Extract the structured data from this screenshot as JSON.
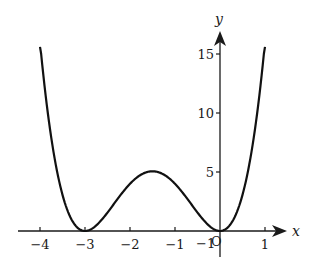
{
  "chart_data": {
    "type": "line",
    "title": "",
    "xlabel": "x",
    "ylabel": "y",
    "function": "y = x^2 (x + 3)^2",
    "xlim": [
      -4,
      1
    ],
    "ylim": [
      0,
      16
    ],
    "grid": false,
    "legend": null,
    "x_ticks": [
      -4,
      -3,
      -2,
      -1,
      1
    ],
    "x_tick_labels": [
      "−4",
      "−3",
      "−2",
      "−1",
      "1"
    ],
    "y_ticks": [
      5,
      10,
      15
    ],
    "y_tick_labels": [
      "5",
      "10",
      "15"
    ],
    "origin_label": "O",
    "series": [
      {
        "name": "curve",
        "x": [
          -4,
          -3.75,
          -3.5,
          -3.25,
          -3,
          -2.75,
          -2.5,
          -2.25,
          -2,
          -1.75,
          -1.5,
          -1.25,
          -1,
          -0.75,
          -0.5,
          -0.25,
          0,
          0.25,
          0.5,
          0.75,
          1
        ],
        "y": [
          16,
          7.91,
          3.06,
          0.66,
          0,
          0.47,
          1.56,
          2.85,
          4,
          4.79,
          5.06,
          4.79,
          4,
          2.85,
          1.56,
          0.47,
          0,
          0.66,
          3.06,
          7.91,
          16
        ]
      }
    ],
    "key_points": {
      "minima": [
        [
          -3,
          0
        ],
        [
          0,
          0
        ]
      ],
      "local_maximum": [
        -1.5,
        5.0625
      ]
    }
  }
}
